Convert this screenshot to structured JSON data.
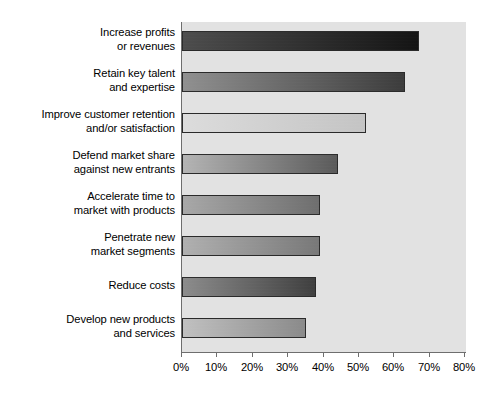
{
  "chart_data": {
    "type": "bar",
    "orientation": "horizontal",
    "title": "",
    "subtitle": "",
    "xlabel": "",
    "ylabel": "",
    "xlim": [
      0,
      80
    ],
    "grid": false,
    "legend": null,
    "legend_position": "none",
    "unit": "%",
    "categories": [
      "Increase profits\nor revenues",
      "Retain key talent\nand expertise",
      "Improve customer retention\nand/or satisfaction",
      "Defend market share\nagainst new entrants",
      "Accelerate time to\nmarket with products",
      "Penetrate new\nmarket segments",
      "Reduce costs",
      "Develop new products\nand services"
    ],
    "values": [
      67,
      63,
      52,
      44,
      39,
      39,
      38,
      35
    ],
    "tick_labels": [
      "0%",
      "10%",
      "20%",
      "30%",
      "40%",
      "50%",
      "60%",
      "70%",
      "80%"
    ],
    "tick_values": [
      0,
      10,
      20,
      30,
      40,
      50,
      60,
      70,
      80
    ],
    "bar_fills": [
      {
        "from": "#4d4d4d",
        "to": "#141414"
      },
      {
        "from": "#909090",
        "to": "#3c3c3c"
      },
      {
        "from": "#dcdcdc",
        "to": "#c4c4c4"
      },
      {
        "from": "#b4b4b4",
        "to": "#5a5a5a"
      },
      {
        "from": "#a8a8a8",
        "to": "#6e6e6e"
      },
      {
        "from": "#b0b0b0",
        "to": "#787878"
      },
      {
        "from": "#8c8c8c",
        "to": "#3f3f3f"
      },
      {
        "from": "#c0c0c0",
        "to": "#8a8a8a"
      }
    ],
    "plot_background": "#e2e2e2",
    "axis_color": "#6e6e6e",
    "bar_border_color": "#2a2a2a",
    "text_color": "#000000"
  }
}
